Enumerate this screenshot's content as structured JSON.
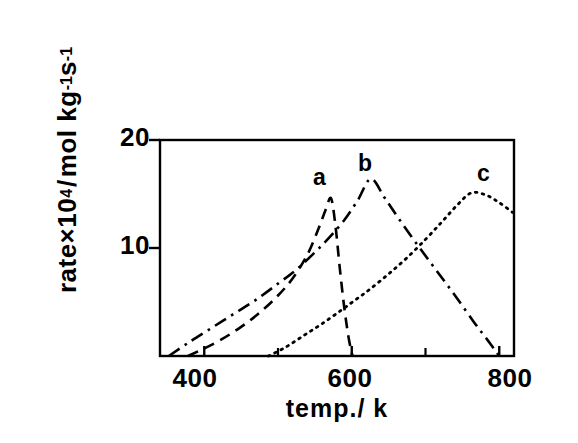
{
  "chart_data": {
    "type": "line",
    "title": "",
    "xlabel": "temp./ k",
    "ylabel": "rate×10⁴/mol kg⁻¹s⁻¹",
    "ylabel_parts": {
      "prefix": "rate×10",
      "sup1": "4",
      "slash": "/",
      "mid": "mol kg",
      "sup2": "-1",
      "unit2": "s",
      "sup3": "-1"
    },
    "xlim": [
      340,
      820
    ],
    "ylim": [
      0,
      20
    ],
    "xticks_major": [
      400,
      600,
      800
    ],
    "xticks_minor": [
      500,
      700
    ],
    "xtick_labels": [
      "400",
      "600",
      "800"
    ],
    "yticks": [
      10,
      20
    ],
    "ytick_labels": [
      "10",
      "20"
    ],
    "grid": false,
    "legend": "inline-curve-labels",
    "series": [
      {
        "name": "a",
        "label": "a",
        "linestyle": "dashed",
        "color": "#000000",
        "peak_x": 572,
        "peak_y": 14.6,
        "x": [
          378,
          400,
          425,
          450,
          475,
          500,
          520,
          540,
          555,
          565,
          572,
          578,
          584,
          590,
          596,
          601
        ],
        "y": [
          0.0,
          0.7,
          1.6,
          2.7,
          4.0,
          5.6,
          7.2,
          9.4,
          11.8,
          13.6,
          14.6,
          12.0,
          8.0,
          4.4,
          1.6,
          0.0
        ]
      },
      {
        "name": "b",
        "label": "b",
        "linestyle": "dashdot",
        "color": "#000000",
        "peak_x": 626,
        "peak_y": 16.4,
        "x": [
          352,
          380,
          410,
          440,
          470,
          500,
          525,
          550,
          570,
          590,
          608,
          626,
          645,
          665,
          690,
          715,
          740,
          765,
          785,
          800
        ],
        "y": [
          0.0,
          1.3,
          2.6,
          3.9,
          5.2,
          6.7,
          8.0,
          9.6,
          11.0,
          12.6,
          14.4,
          16.4,
          14.6,
          12.6,
          10.2,
          7.9,
          5.6,
          3.2,
          1.4,
          0.0
        ]
      },
      {
        "name": "c",
        "label": "c",
        "linestyle": "dotted",
        "color": "#000000",
        "peak_x": 762,
        "peak_y": 15.1,
        "x": [
          487,
          510,
          535,
          560,
          585,
          605,
          625,
          650,
          675,
          700,
          722,
          742,
          762,
          782,
          800,
          818
        ],
        "y": [
          0.0,
          0.8,
          1.9,
          3.0,
          4.2,
          5.2,
          6.2,
          7.6,
          9.1,
          10.8,
          12.4,
          13.9,
          15.1,
          14.9,
          14.2,
          13.3
        ]
      }
    ],
    "curve_labels": [
      {
        "text": "a",
        "x_px": 313,
        "y_px": 166
      },
      {
        "text": "b",
        "x_px": 358,
        "y_px": 152
      },
      {
        "text": "c",
        "x_px": 477,
        "y_px": 162
      }
    ]
  },
  "axes": {
    "plot_left_px": 160,
    "plot_right_px": 514,
    "plot_top_px": 140,
    "plot_bottom_px": 356
  }
}
